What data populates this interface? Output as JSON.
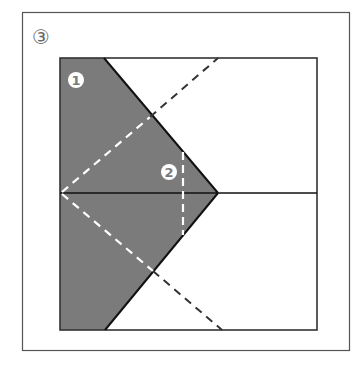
{
  "figure": {
    "step_label": "③",
    "markers": [
      {
        "id": "1",
        "glyph": "1",
        "x": 76,
        "y": 80
      },
      {
        "id": "2",
        "glyph": "2",
        "x": 169,
        "y": 172
      }
    ],
    "colors": {
      "fill": "#7b7b7b",
      "line": "#222222",
      "dash_light": "#ffffff",
      "dash_dark": "#333333",
      "frame": "#555555"
    }
  }
}
